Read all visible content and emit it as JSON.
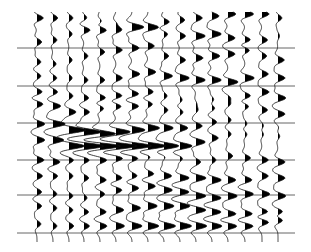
{
  "chart_data": {
    "type": "seismic-wiggle",
    "title": "",
    "xlabel": "",
    "ylabel": "",
    "display": "variable-area wiggle trace (positive lobes filled black)",
    "n_traces": 16,
    "trace_x": [
      37,
      53,
      69,
      84,
      100,
      116,
      132,
      148,
      164,
      180,
      196,
      212,
      228,
      245,
      262,
      278
    ],
    "time_range_px": [
      12,
      242
    ],
    "horizontal_lines_y": [
      48,
      86,
      123,
      160,
      195,
      233
    ],
    "horizontal_lines_x_range": [
      17,
      295
    ],
    "wavelet_halfwidth_px": 6,
    "amplitude_scale_px": 14,
    "events": [
      {
        "name": "top-reflector-1",
        "t": [
          18,
          18,
          18,
          18,
          22,
          24,
          26,
          28,
          22,
          20,
          18,
          16,
          14,
          14,
          14,
          18
        ],
        "amp": [
          0.8,
          0.6,
          0.5,
          0.4,
          0.5,
          0.6,
          0.8,
          0.9,
          0.7,
          0.6,
          0.8,
          0.9,
          1.0,
          1.1,
          0.9,
          0.5
        ]
      },
      {
        "name": "reflector-2",
        "t": [
          42,
          40,
          34,
          30,
          30,
          30,
          28,
          26,
          34,
          36,
          36,
          34,
          38,
          40,
          40,
          36
        ],
        "amp": [
          0.6,
          0.5,
          0.4,
          0.8,
          1.0,
          1.0,
          0.9,
          0.6,
          0.5,
          0.7,
          1.2,
          1.2,
          0.9,
          0.8,
          0.7,
          0.2
        ]
      },
      {
        "name": "reflector-3",
        "t": [
          62,
          64,
          60,
          56,
          52,
          50,
          48,
          46,
          56,
          60,
          58,
          56,
          54,
          50,
          56,
          60
        ],
        "amp": [
          0.5,
          0.4,
          0.4,
          0.5,
          0.6,
          0.8,
          0.9,
          0.8,
          0.6,
          0.7,
          0.9,
          1.0,
          0.9,
          0.7,
          0.6,
          0.8
        ]
      },
      {
        "name": "reflector-4",
        "t": [
          76,
          78,
          78,
          80,
          80,
          78,
          74,
          72,
          76,
          78,
          80,
          80,
          82,
          78,
          74,
          78
        ],
        "amp": [
          0.5,
          0.5,
          0.4,
          0.5,
          0.6,
          0.8,
          1.0,
          1.0,
          1.1,
          1.2,
          1.2,
          1.2,
          1.3,
          1.2,
          0.8,
          0.9
        ]
      },
      {
        "name": "reflector-5",
        "t": [
          92,
          92,
          96,
          98,
          98,
          96,
          94,
          92,
          96,
          100,
          104,
          100,
          98,
          96,
          92,
          98
        ],
        "amp": [
          0.7,
          0.6,
          0.5,
          0.6,
          0.8,
          0.9,
          0.9,
          0.7,
          0.4,
          0.3,
          0.3,
          0.4,
          0.6,
          0.8,
          0.9,
          1.0
        ]
      },
      {
        "name": "reflector-6",
        "t": [
          104,
          106,
          112,
          112,
          108,
          106,
          106,
          104,
          110,
          112,
          110,
          108,
          104,
          106,
          110,
          114
        ],
        "amp": [
          0.8,
          1.0,
          0.9,
          0.7,
          0.6,
          0.8,
          0.9,
          0.6,
          0.5,
          0.4,
          0.4,
          0.5,
          0.6,
          0.6,
          0.7,
          0.9
        ]
      },
      {
        "name": "strong-dipping-event-a",
        "t": [
          124,
          124,
          130,
          132,
          134,
          132,
          130,
          128,
          128,
          128,
          126,
          122,
          120,
          124,
          126,
          128
        ],
        "amp": [
          1.0,
          1.6,
          2.2,
          2.3,
          2.2,
          1.9,
          1.7,
          1.5,
          1.2,
          1.0,
          0.8,
          0.6,
          0.4,
          0.3,
          0.3,
          0.2
        ]
      },
      {
        "name": "strong-dipping-event-b",
        "t": [
          140,
          140,
          146,
          146,
          146,
          146,
          146,
          146,
          146,
          146,
          142,
          138,
          134,
          134,
          134,
          136
        ],
        "amp": [
          1.0,
          1.4,
          2.0,
          2.6,
          2.8,
          2.8,
          2.6,
          2.4,
          2.0,
          1.6,
          1.2,
          0.8,
          0.4,
          0.3,
          0.3,
          0.3
        ]
      },
      {
        "name": "reflector-9",
        "t": [
          160,
          162,
          160,
          160,
          160,
          158,
          158,
          156,
          156,
          158,
          162,
          160,
          156,
          158,
          160,
          162
        ],
        "amp": [
          0.9,
          0.9,
          0.6,
          0.7,
          0.9,
          1.0,
          0.9,
          0.6,
          0.4,
          0.4,
          0.6,
          0.5,
          0.6,
          0.7,
          0.8,
          0.9
        ]
      },
      {
        "name": "reflector-10",
        "t": [
          176,
          176,
          176,
          178,
          180,
          178,
          176,
          174,
          176,
          178,
          178,
          180,
          180,
          180,
          176,
          178
        ],
        "amp": [
          0.7,
          0.6,
          0.5,
          0.6,
          0.8,
          0.8,
          0.7,
          0.8,
          1.0,
          1.2,
          1.3,
          1.2,
          1.0,
          0.9,
          0.8,
          0.9
        ]
      },
      {
        "name": "reflector-11",
        "t": [
          192,
          194,
          196,
          198,
          194,
          190,
          188,
          186,
          190,
          192,
          196,
          198,
          196,
          194,
          194,
          196
        ],
        "amp": [
          0.6,
          0.5,
          0.5,
          0.4,
          0.6,
          0.8,
          0.9,
          1.0,
          1.1,
          1.2,
          1.3,
          1.2,
          1.2,
          1.1,
          1.0,
          1.0
        ]
      },
      {
        "name": "reflector-12",
        "t": [
          206,
          208,
          210,
          212,
          212,
          210,
          208,
          206,
          206,
          206,
          210,
          212,
          214,
          214,
          212,
          212
        ],
        "amp": [
          0.6,
          0.5,
          0.5,
          0.6,
          0.8,
          1.0,
          1.1,
          1.2,
          1.3,
          1.3,
          1.3,
          1.2,
          1.1,
          1.0,
          0.9,
          0.9
        ]
      },
      {
        "name": "bottom-reflector",
        "t": [
          224,
          226,
          226,
          226,
          226,
          226,
          226,
          226,
          226,
          226,
          226,
          226,
          226,
          226,
          222,
          220
        ],
        "amp": [
          0.5,
          0.5,
          0.6,
          0.7,
          0.9,
          1.1,
          1.3,
          1.4,
          1.5,
          1.5,
          1.4,
          1.3,
          1.2,
          1.1,
          1.0,
          0.9
        ]
      }
    ]
  }
}
